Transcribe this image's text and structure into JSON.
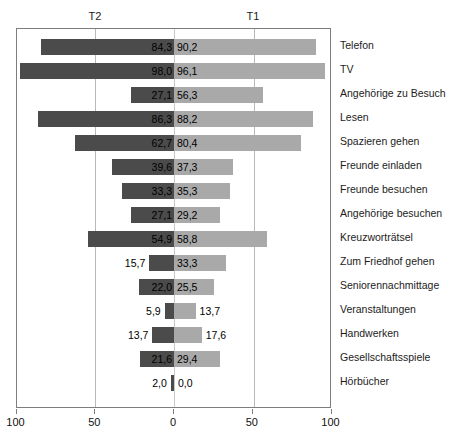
{
  "chart_data": {
    "type": "bar",
    "orientation": "horizontal",
    "style": "diverging-bidirectional",
    "title": "",
    "subtitle": "",
    "xlabel": "",
    "ylabel": "",
    "xlim": [
      -100,
      100
    ],
    "axis_tick_labels": [
      "100",
      "50",
      "0",
      "50",
      "100"
    ],
    "axis_tick_values": [
      -100,
      -50,
      0,
      50,
      100
    ],
    "grid": true,
    "legend_position": "top",
    "group_labels": [
      {
        "name": "T2",
        "side": "left",
        "color": "#4b4b4b"
      },
      {
        "name": "T1",
        "side": "right",
        "color": "#a9a9a9"
      }
    ],
    "categories": [
      "Telefon",
      "TV",
      "Angehörige zu Besuch",
      "Lesen",
      "Spazieren gehen",
      "Freunde einladen",
      "Freunde besuchen",
      "Angehörige besuchen",
      "Kreuzworträtsel",
      "Zum Friedhof gehen",
      "Seniorennachmittage",
      "Veranstaltungen",
      "Handwerken",
      "Gesellschaftsspiele",
      "Hörbücher"
    ],
    "series": [
      {
        "name": "T2",
        "side": "left",
        "color": "#4b4b4b",
        "values": [
          84.3,
          98.0,
          27.1,
          86.3,
          62.7,
          39.6,
          33.3,
          27.1,
          54.9,
          15.7,
          22.0,
          5.9,
          13.7,
          21.6,
          2.0
        ],
        "labels": [
          "84,3",
          "98,0",
          "27,1",
          "86,3",
          "62,7",
          "39,6",
          "33,3",
          "27,1",
          "54,9",
          "15,7",
          "22,0",
          "5,9",
          "13,7",
          "21,6",
          "2,0"
        ]
      },
      {
        "name": "T1",
        "side": "right",
        "color": "#a9a9a9",
        "values": [
          90.2,
          96.1,
          56.3,
          88.2,
          80.4,
          37.3,
          35.3,
          29.2,
          58.8,
          33.3,
          25.5,
          13.7,
          17.6,
          29.4,
          0.0
        ],
        "labels": [
          "90,2",
          "96,1",
          "56,3",
          "88,2",
          "80,4",
          "37,3",
          "35,3",
          "29,2",
          "58,8",
          "33,3",
          "25,5",
          "13,7",
          "17,6",
          "29,4",
          "0,0"
        ]
      }
    ]
  },
  "colors": {
    "bar_left": "#4b4b4b",
    "bar_right": "#a9a9a9",
    "frame": "#7d7d7d",
    "gridline": "#b9b9b9",
    "background": "#ffffff",
    "text": "#111111"
  }
}
